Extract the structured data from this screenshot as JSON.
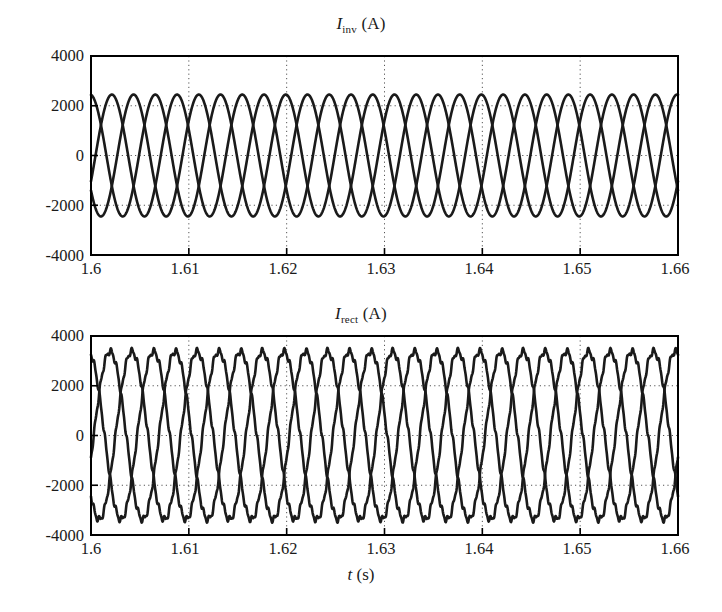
{
  "figure": {
    "background": "#ffffff",
    "line_color": "#1a1a1a",
    "grid_color": "#555555",
    "axis_color": "#000000"
  },
  "chart_data": [
    {
      "type": "line",
      "id": "inverter-current",
      "title": "I_inv (A)",
      "title_symbol": "I",
      "title_subscript": "inv",
      "title_unit": "(A)",
      "xlabel": "",
      "ylabel": "",
      "x": [
        1.6,
        1.66
      ],
      "xlim": [
        1.6,
        1.66
      ],
      "ylim": [
        -4000,
        4000
      ],
      "xticks": [
        1.6,
        1.61,
        1.62,
        1.63,
        1.64,
        1.65,
        1.66
      ],
      "xtick_labels": [
        "1.6",
        "1.61",
        "1.62",
        "1.63",
        "1.64",
        "1.65",
        "1.66"
      ],
      "yticks": [
        -4000,
        -2000,
        0,
        2000,
        4000
      ],
      "ytick_labels": [
        "-4000",
        "-2000",
        "0",
        "2000",
        "4000"
      ],
      "grid": true,
      "grid_style": "dotted",
      "legend": "none",
      "waveform": {
        "shape": "three-phase-sine",
        "amplitude": 2450,
        "frequency_hz": 150,
        "period_s": 0.006667,
        "phases_deg": [
          -25,
          95,
          215
        ],
        "phase_count": 3,
        "ripple_amplitude": 0,
        "ripple_harmonic": 0,
        "start_values_at_1p6": [
          -900,
          2450,
          -2000
        ]
      }
    },
    {
      "type": "line",
      "id": "rectifier-current",
      "title": "I_rect (A)",
      "title_symbol": "I",
      "title_subscript": "rect",
      "title_unit": "(A)",
      "xlabel": "t (s)",
      "xlabel_symbol": "t",
      "xlabel_unit": "(s)",
      "ylabel": "",
      "x": [
        1.6,
        1.66
      ],
      "xlim": [
        1.6,
        1.66
      ],
      "ylim": [
        -4000,
        4000
      ],
      "xticks": [
        1.6,
        1.61,
        1.62,
        1.63,
        1.64,
        1.65,
        1.66
      ],
      "xtick_labels": [
        "1.6",
        "1.61",
        "1.62",
        "1.63",
        "1.64",
        "1.65",
        "1.66"
      ],
      "yticks": [
        -4000,
        -2000,
        0,
        2000,
        4000
      ],
      "ytick_labels": [
        "-4000",
        "-2000",
        "0",
        "2000",
        "4000"
      ],
      "grid": true,
      "grid_style": "dotted",
      "legend": "none",
      "waveform": {
        "shape": "three-phase-sine-with-ripple",
        "amplitude": 3380,
        "frequency_hz": 150,
        "period_s": 0.006667,
        "phases_deg": [
          -15,
          105,
          225
        ],
        "phase_count": 3,
        "ripple_amplitude": 110,
        "ripple_harmonic": 12,
        "start_values_at_1p6": [
          700,
          2450,
          -3250
        ]
      }
    }
  ]
}
